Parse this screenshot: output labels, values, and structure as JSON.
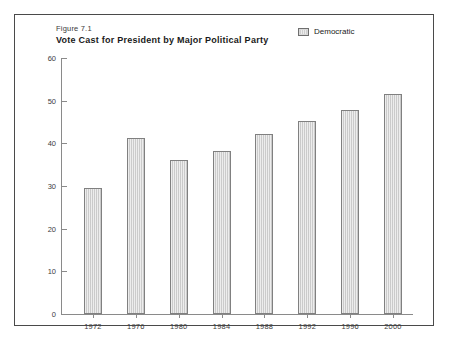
{
  "figure": {
    "number": "Figure 7.1",
    "title": "Vote Cast for President by Major Political Party"
  },
  "legend": {
    "entries": [
      {
        "label": "Democratic",
        "swatch": "hatched-gray-swatch",
        "color": "#d7d7d7"
      }
    ]
  },
  "chart_data": {
    "type": "bar",
    "title": "Vote Cast for President by Major Political Party",
    "subtitle": "Figure 7.1",
    "categories": [
      "1972",
      "1976",
      "1980",
      "1984",
      "1988",
      "1992",
      "1996",
      "2000"
    ],
    "series": [
      {
        "name": "Democratic",
        "color": "#d7d7d7",
        "values": [
          29.5,
          41.3,
          36.0,
          38.2,
          42.2,
          45.2,
          47.8,
          51.5
        ]
      }
    ],
    "values": [
      29.5,
      41.3,
      36.0,
      38.2,
      42.2,
      45.2,
      47.8,
      51.5
    ],
    "xlabel": "",
    "ylabel": "",
    "ylim": [
      0,
      60
    ],
    "yticks": [
      0,
      10,
      20,
      30,
      40,
      50,
      60
    ],
    "xticks": [
      "1972",
      "1976",
      "1980",
      "1984",
      "1988",
      "1992",
      "1996",
      "2000"
    ],
    "grid": false,
    "legend_position": "top-right"
  }
}
